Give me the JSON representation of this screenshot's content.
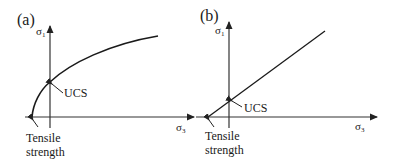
{
  "panels": [
    {
      "id": "a",
      "label": "(a)",
      "y_axis_label": "σ",
      "y_axis_sub": "1",
      "x_axis_label": "σ",
      "x_axis_sub": "3",
      "curve_type": "nonlinear",
      "annotation_ucs": "UCS",
      "annotation_tensile_line1": "Tensile",
      "annotation_tensile_line2": "strength"
    },
    {
      "id": "b",
      "label": "(b)",
      "y_axis_label": "σ",
      "y_axis_sub": "1",
      "x_axis_label": "σ",
      "x_axis_sub": "3",
      "curve_type": "linear",
      "annotation_ucs": "UCS",
      "annotation_tensile_line1": "Tensile",
      "annotation_tensile_line2": "strength"
    }
  ],
  "colors": {
    "line": "#1a1a1a",
    "axis": "#333333",
    "background": "#ffffff"
  }
}
